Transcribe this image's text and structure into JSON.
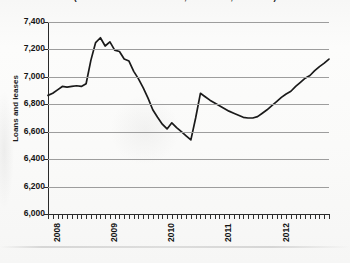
{
  "figure": {
    "title_clipped": "(total bank loans and leases, 2008–2012, in billions)",
    "background_note": "scanned-page"
  },
  "chart_data": {
    "type": "line",
    "title": "(total bank loans and leases, 2008–2012, in billions)",
    "xlabel": "",
    "ylabel": "Loans and leases",
    "ylim": [
      6000,
      7400
    ],
    "ytick_labels": [
      "7,400",
      "7,200",
      "7,000",
      "6,800",
      "6,600",
      "6,400",
      "6,200",
      "6,000"
    ],
    "ytick_values": [
      7400,
      7200,
      7000,
      6800,
      6600,
      6400,
      6200,
      6000
    ],
    "grid": true,
    "grid_axis": "y",
    "legend": false,
    "xtick_labels": [
      "2008",
      "2009",
      "2010",
      "2011",
      "2012"
    ],
    "xtick_values": [
      2008,
      2009,
      2010,
      2011,
      2012
    ],
    "x_minor_ticks": "monthly",
    "line_color": "#1a1a1a",
    "series": [
      {
        "name": "Loans and leases",
        "x": [
          "2008-01",
          "2008-02",
          "2008-03",
          "2008-04",
          "2008-05",
          "2008-06",
          "2008-07",
          "2008-08",
          "2008-09",
          "2008-10",
          "2008-11",
          "2008-12",
          "2009-01",
          "2009-02",
          "2009-03",
          "2009-04",
          "2009-05",
          "2009-06",
          "2009-07",
          "2009-08",
          "2009-09",
          "2009-10",
          "2009-11",
          "2009-12",
          "2010-01",
          "2010-02",
          "2010-03",
          "2010-04",
          "2010-05",
          "2010-06",
          "2010-07",
          "2010-08",
          "2010-09",
          "2010-10",
          "2010-11",
          "2010-12",
          "2011-01",
          "2011-02",
          "2011-03",
          "2011-04",
          "2011-05",
          "2011-06",
          "2011-07",
          "2011-08",
          "2011-09",
          "2011-10",
          "2011-11",
          "2011-12",
          "2012-01",
          "2012-02",
          "2012-03",
          "2012-04",
          "2012-05",
          "2012-06",
          "2012-07",
          "2012-08",
          "2012-09",
          "2012-10",
          "2012-11",
          "2012-12"
        ],
        "values": [
          6865,
          6880,
          6905,
          6930,
          6925,
          6930,
          6935,
          6930,
          6950,
          7120,
          7250,
          7285,
          7225,
          7255,
          7195,
          7185,
          7130,
          7115,
          7040,
          6985,
          6920,
          6845,
          6760,
          6705,
          6655,
          6620,
          6665,
          6630,
          6600,
          6570,
          6540,
          6700,
          6880,
          6855,
          6830,
          6810,
          6790,
          6770,
          6750,
          6735,
          6720,
          6705,
          6700,
          6700,
          6710,
          6735,
          6760,
          6790,
          6820,
          6850,
          6875,
          6895,
          6930,
          6960,
          6990,
          7010,
          7045,
          7075,
          7100,
          7130
        ]
      }
    ]
  }
}
